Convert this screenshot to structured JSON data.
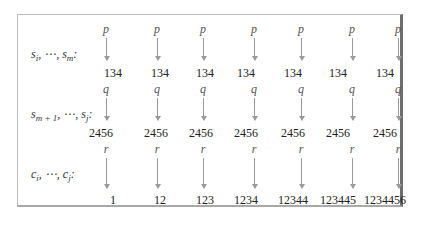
{
  "figure": {
    "rows": [
      {
        "label_html": "s<sub>i</sub>, ⋯, s<sub>m</sub>:",
        "label": "s_i, ⋯, s_m:",
        "symbol": "p",
        "values": [
          "134",
          "134",
          "134",
          "134",
          "134",
          "134",
          "134"
        ]
      },
      {
        "label_html": "s<sub>m + 1</sub>, ⋯, s<sub>j</sub>:",
        "label": "s_{m+1}, ⋯, s_j:",
        "symbol": "q",
        "values": [
          "2456",
          "2456",
          "2456",
          "2456",
          "2456",
          "2456",
          "2456"
        ]
      },
      {
        "label_html": "c<sub>i</sub>, ⋯, c<sub>j</sub>:",
        "label": "c_i, ⋯, c_j:",
        "symbol": "r",
        "values": [
          "1",
          "12",
          "123",
          "1234",
          "12344",
          "123445",
          "1234456"
        ]
      }
    ],
    "caption": ""
  },
  "layout": {
    "column_arrow_x": [
      106,
      157,
      203,
      254,
      301,
      352,
      398
    ],
    "column_value_x": [
      113,
      160,
      205,
      246,
      293,
      338,
      385
    ]
  }
}
